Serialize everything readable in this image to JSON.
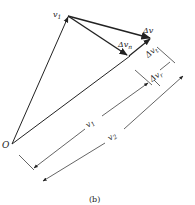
{
  "figure": {
    "caption": "(b)",
    "labels": {
      "origin": "O",
      "v1_tip": "v",
      "v1_tip_sub": "1",
      "delta_v": "Δv",
      "delta_vn": "Δv",
      "delta_vn_sub": "n",
      "delta_vt": "Δv",
      "delta_vt_sub": "t",
      "delta_vr": "Δv",
      "delta_vr_sub": "r",
      "dim_v1": "v",
      "dim_v1_sub": "1",
      "dim_v2": "v",
      "dim_v2_sub": "2"
    },
    "stroke_color": "#222222"
  }
}
